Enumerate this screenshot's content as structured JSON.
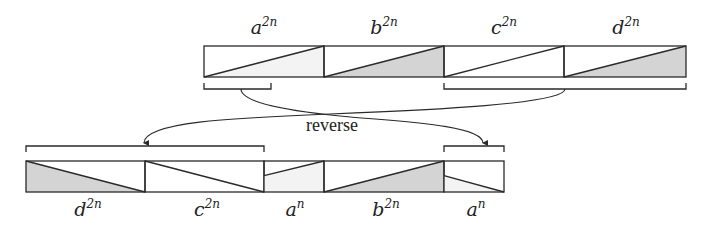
{
  "diagram": {
    "colors": {
      "stroke": "#2a2a2a",
      "shade": "#d4d4d4",
      "background": "#ffffff"
    },
    "arrow_label": "reverse",
    "top_row": {
      "blocks": [
        {
          "base": "a",
          "exp": "2n",
          "x": 204,
          "w": 120,
          "diag": "up",
          "shade": "light"
        },
        {
          "base": "b",
          "exp": "2n",
          "x": 324,
          "w": 120,
          "diag": "up",
          "shade": "dark"
        },
        {
          "base": "c",
          "exp": "2n",
          "x": 444,
          "w": 120,
          "diag": "up",
          "shade": "none"
        },
        {
          "base": "d",
          "exp": "2n",
          "x": 564,
          "w": 122,
          "diag": "up",
          "shade": "dark"
        }
      ],
      "brackets": [
        {
          "name": "first-half-a",
          "x1": 204,
          "x2": 271
        },
        {
          "name": "second-half-a-to-d",
          "x1": 444,
          "x2": 686
        }
      ]
    },
    "bottom_row": {
      "blocks": [
        {
          "base": "d",
          "exp": "2n",
          "x": 26,
          "w": 119,
          "diag": "down",
          "shade": "dark"
        },
        {
          "base": "c",
          "exp": "2n",
          "x": 145,
          "w": 119,
          "diag": "down",
          "shade": "none"
        },
        {
          "base": "a",
          "exp": "n",
          "x": 264,
          "w": 60,
          "diag": "up-half",
          "shade": "light"
        },
        {
          "base": "b",
          "exp": "2n",
          "x": 324,
          "w": 120,
          "diag": "up",
          "shade": "dark"
        },
        {
          "base": "a",
          "exp": "n",
          "x": 444,
          "w": 60,
          "diag": "down-half",
          "shade": "light"
        }
      ],
      "brackets": [
        {
          "name": "reversed-dc",
          "x1": 26,
          "x2": 264
        },
        {
          "name": "reversed-a",
          "x1": 444,
          "x2": 504
        }
      ]
    }
  }
}
